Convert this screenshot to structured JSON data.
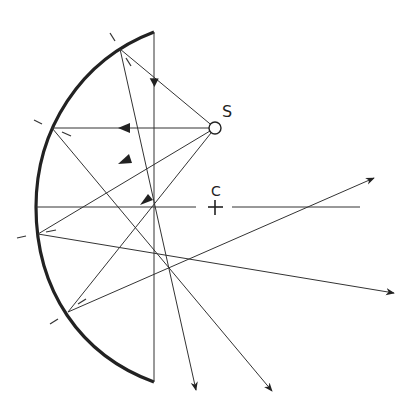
{
  "diagram": {
    "type": "concave-mirror-ray-diagram",
    "labels": {
      "source": "S",
      "center": "C"
    },
    "colors": {
      "ink": "#222222",
      "background": "#ffffff"
    },
    "elements": {
      "mirror": "spherical concave mirror arc (thick)",
      "aperture_line": "vertical chord line",
      "optical_axis": "horizontal axis through C",
      "source_point": "small circle S",
      "normals": "dashed normal tick marks at 4 reflection points",
      "rays": "incident rays from S and reflected rays with arrowheads"
    }
  }
}
